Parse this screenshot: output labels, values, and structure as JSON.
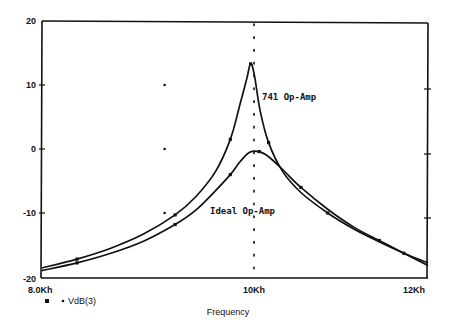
{
  "chart_data": {
    "type": "line",
    "title": "",
    "xlabel": "Frequency",
    "ylabel": "",
    "xscale": "log",
    "xlim": [
      8000,
      12000
    ],
    "ylim": [
      -20,
      20
    ],
    "x_tick_labels": [
      "8.0Kh",
      "10Kh",
      "12Kh"
    ],
    "x_ticks": [
      8000,
      10000,
      12000
    ],
    "y_tick_labels": [
      "20",
      "10",
      "0",
      "-10",
      "-20"
    ],
    "y_ticks": [
      20,
      10,
      0,
      -10,
      -20
    ],
    "grid": false,
    "cursor_line_x": 10000,
    "legend": {
      "position": "bottom-left",
      "entries": [
        "VdB(3)"
      ]
    },
    "annotations": [
      {
        "text": "741 Op-Amp",
        "x": 10050,
        "y": 7.5
      },
      {
        "text": "Ideal Op-Amp",
        "x": 9650,
        "y": -10
      }
    ],
    "series": [
      {
        "name": "741 Op-Amp",
        "x": [
          8000,
          8300,
          8600,
          8900,
          9200,
          9400,
          9600,
          9750,
          9850,
          9920,
          9960,
          10000,
          10060,
          10150,
          10300,
          10500,
          10800,
          11100,
          11400,
          11700,
          12000
        ],
        "values": [
          -18.6,
          -17.2,
          -15.5,
          -13.3,
          -10.3,
          -7.5,
          -3.5,
          1.5,
          7.0,
          11.0,
          13.3,
          11.5,
          6.0,
          1.0,
          -3.5,
          -6.8,
          -10.0,
          -12.5,
          -14.5,
          -16.3,
          -17.8
        ]
      },
      {
        "name": "Ideal Op-Amp",
        "x": [
          8000,
          8300,
          8600,
          8900,
          9200,
          9400,
          9600,
          9750,
          9850,
          9950,
          10050,
          10150,
          10300,
          10500,
          10800,
          11100,
          11400,
          11700,
          12000
        ],
        "values": [
          -19.0,
          -17.8,
          -16.3,
          -14.4,
          -11.8,
          -9.6,
          -6.5,
          -4.0,
          -2.0,
          -0.5,
          -0.4,
          -1.2,
          -3.2,
          -6.0,
          -9.4,
          -12.2,
          -14.3,
          -16.3,
          -18.2
        ]
      }
    ],
    "stray_markers": [
      {
        "x": 9100,
        "y": 10
      },
      {
        "x": 9100,
        "y": 0
      },
      {
        "x": 9100,
        "y": -10
      }
    ]
  },
  "legend_label": "VdB(3)",
  "x_axis_title": "Frequency",
  "annotation_741": "741 Op-Amp",
  "annotation_ideal": "Ideal Op-Amp",
  "tick_x_8k": "8.0Kh",
  "tick_x_10k": "10Kh",
  "tick_x_12k": "12Kh",
  "tick_y_20": "20",
  "tick_y_10": "10",
  "tick_y_0": "0",
  "tick_y_m10": "-10",
  "tick_y_m20": "-20"
}
